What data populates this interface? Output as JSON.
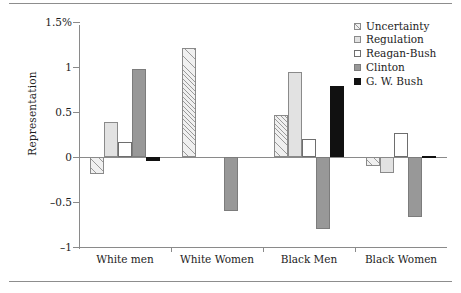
{
  "chart_data": {
    "type": "bar",
    "title": "",
    "xlabel": "",
    "ylabel": "Representation",
    "ylim": [
      -1,
      1.5
    ],
    "grid": false,
    "legend_position": "top-right",
    "ytick_labels": [
      "1.5%",
      "1",
      "0.5",
      "0",
      "-0.5",
      "-1"
    ],
    "ytick_values": [
      1.5,
      1,
      0.5,
      0,
      -0.5,
      -1
    ],
    "categories": [
      "White men",
      "White Women",
      "Black Men",
      "Black Women"
    ],
    "series": [
      {
        "name": "Uncertainty",
        "values": [
          -0.19,
          1.21,
          0.47,
          -0.1
        ]
      },
      {
        "name": "Regulation",
        "values": [
          0.39,
          0.0,
          0.94,
          -0.18
        ]
      },
      {
        "name": "Reagan-Bush",
        "values": [
          0.17,
          0.0,
          0.2,
          0.27
        ]
      },
      {
        "name": "Clinton",
        "values": [
          0.98,
          -0.6,
          -0.8,
          -0.67
        ]
      },
      {
        "name": "G. W. Bush",
        "values": [
          -0.04,
          0.0,
          0.79,
          0.01
        ]
      }
    ],
    "series_styles": [
      "hatched-light",
      "light-gray",
      "white",
      "medium-gray",
      "black"
    ],
    "colors": {
      "uncertainty": "#f0f0f0",
      "regulation": "#e2e2e2",
      "reagan_bush": "#ffffff",
      "clinton": "#989898",
      "gw_bush": "#111111",
      "axis": "#8a8a8a",
      "text": "#1c1c1c"
    }
  },
  "legend": {
    "items": [
      {
        "label": "Uncertainty"
      },
      {
        "label": "Regulation"
      },
      {
        "label": "Reagan-Bush"
      },
      {
        "label": "Clinton"
      },
      {
        "label": "G. W. Bush"
      }
    ]
  }
}
